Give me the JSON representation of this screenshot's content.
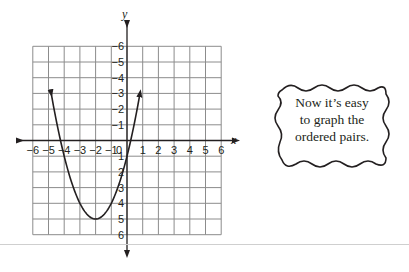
{
  "chart_data": {
    "type": "line",
    "title": "",
    "xlabel": "x",
    "ylabel": "y",
    "xlim": [
      -6,
      6
    ],
    "ylim": [
      -6,
      6
    ],
    "grid": true,
    "x_ticks": [
      -6,
      -5,
      -4,
      -3,
      -2,
      -1,
      0,
      1,
      2,
      3,
      4,
      5,
      6
    ],
    "y_ticks": [
      -6,
      -5,
      -4,
      -3,
      -2,
      -1,
      1,
      2,
      3,
      4,
      5,
      6
    ],
    "series": [
      {
        "name": "parabola",
        "equation": "y = (x + 2)^2 - 5",
        "vertex": [
          -2,
          -5
        ],
        "x_intercepts": [
          -4.24,
          0.24
        ],
        "y_intercept": -1,
        "arrows_at": [
          [
            -4.83,
            3
          ],
          [
            0.83,
            3
          ]
        ],
        "x": [
          -4.83,
          -4.5,
          -4,
          -3.5,
          -3,
          -2.5,
          -2,
          -1.5,
          -1,
          -0.5,
          0,
          0.5,
          0.83
        ],
        "y": [
          3,
          1.25,
          -1,
          -2.75,
          -4,
          -4.75,
          -5,
          -4.75,
          -4,
          -2.75,
          -1,
          1.25,
          3
        ]
      }
    ]
  },
  "axes": {
    "x_label": "x",
    "y_label": "y",
    "x_tick_labels": [
      "−6",
      "−5",
      "−4",
      "−3",
      "−2",
      "−1",
      "0",
      "1",
      "2",
      "3",
      "4",
      "5",
      "6"
    ],
    "y_tick_labels": [
      "6",
      "5",
      "4",
      "3",
      "2",
      "1",
      "−1",
      "−2",
      "−3",
      "−4",
      "−5",
      "−6"
    ]
  },
  "speech_bubble": {
    "lines": [
      "Now it’s easy",
      "to graph the",
      "ordered pairs."
    ]
  }
}
